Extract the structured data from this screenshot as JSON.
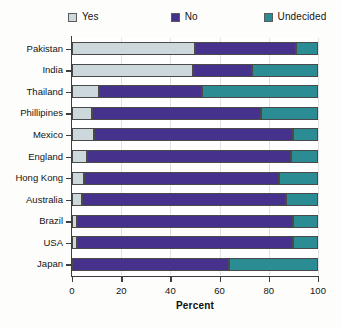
{
  "legend": {
    "items": [
      {
        "label": "Yes",
        "color": "#cdd8dc",
        "icon": "legend-swatch-yes"
      },
      {
        "label": "No",
        "color": "#46318c",
        "icon": "legend-swatch-no"
      },
      {
        "label": "Undecided",
        "color": "#2c8c93",
        "icon": "legend-swatch-undecided"
      }
    ]
  },
  "chart_data": {
    "type": "bar",
    "orientation": "horizontal",
    "stacked": true,
    "title": "",
    "xlabel": "Percent",
    "ylabel": "",
    "xlim": [
      0,
      100
    ],
    "xticks": [
      0,
      20,
      40,
      60,
      80,
      100
    ],
    "grid": true,
    "legend_position": "top",
    "categories": [
      "Pakistan",
      "India",
      "Thailand",
      "Phillipines",
      "Mexico",
      "England",
      "Hong Kong",
      "Australia",
      "Brazil",
      "USA",
      "Japan"
    ],
    "series": [
      {
        "name": "Yes",
        "color": "#cdd8dc",
        "values": [
          50,
          49,
          11,
          8,
          9,
          6,
          5,
          4,
          2,
          2,
          0
        ]
      },
      {
        "name": "No",
        "color": "#46318c",
        "values": [
          41,
          24,
          42,
          69,
          81,
          83,
          79,
          83,
          88,
          88,
          64
        ]
      },
      {
        "name": "Undecided",
        "color": "#2c8c93",
        "values": [
          9,
          27,
          47,
          23,
          10,
          11,
          16,
          13,
          10,
          10,
          36
        ]
      }
    ]
  }
}
